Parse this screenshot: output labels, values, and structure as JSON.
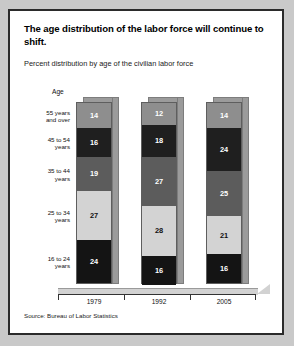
{
  "figure": {
    "title": "The age distribution of the labor force will continue to shift.",
    "subtitle": "Percent distribution by age of the civilian labor force",
    "age_header": "Age",
    "source": "Source: Bureau of Labor Statistics"
  },
  "chart_data": {
    "type": "bar",
    "subtype": "stacked-column-100-percent",
    "title": "The age distribution of the labor force will continue to shift.",
    "subtitle": "Percent distribution by age of the civilian labor force",
    "xlabel": "",
    "ylabel": "Percent distribution by age of the civilian labor force",
    "ylim": [
      0,
      100
    ],
    "grid": false,
    "legend": "left-axis-labels",
    "categories": [
      "1979",
      "1992",
      "2005"
    ],
    "series": [
      {
        "name": "16 to 24 years",
        "values": [
          24,
          16,
          16
        ],
        "color": "#141414"
      },
      {
        "name": "25 to 34 years",
        "values": [
          27,
          28,
          21
        ],
        "color": "#d3d3d3"
      },
      {
        "name": "35 to 44 years",
        "values": [
          19,
          27,
          25
        ],
        "color": "#5c5c5c"
      },
      {
        "name": "45 to 54 years",
        "values": [
          16,
          18,
          24
        ],
        "color": "#1f1f1f"
      },
      {
        "name": "55 years and over",
        "values": [
          14,
          12,
          14
        ],
        "color": "#8e8e8e"
      }
    ],
    "source": "Source: Bureau of Labor Statistics"
  },
  "age_groups": [
    {
      "label_line1": "55 years",
      "label_line2": "and over"
    },
    {
      "label_line1": "45 to 54",
      "label_line2": "years"
    },
    {
      "label_line1": "35 to 44",
      "label_line2": "years"
    },
    {
      "label_line1": "25 to 34",
      "label_line2": "years"
    },
    {
      "label_line1": "16 to 24",
      "label_line2": "years"
    }
  ],
  "years": [
    "1979",
    "1992",
    "2005"
  ],
  "bars": [
    {
      "year": "1979",
      "segments": [
        {
          "group": "55 years and over",
          "value": "14"
        },
        {
          "group": "45 to 54 years",
          "value": "16"
        },
        {
          "group": "35 to 44 years",
          "value": "19"
        },
        {
          "group": "25 to 34 years",
          "value": "27"
        },
        {
          "group": "16 to 24 years",
          "value": "24"
        }
      ]
    },
    {
      "year": "1992",
      "segments": [
        {
          "group": "55 years and over",
          "value": "12"
        },
        {
          "group": "45 to 54 years",
          "value": "18"
        },
        {
          "group": "35 to 44 years",
          "value": "27"
        },
        {
          "group": "25 to 34 years",
          "value": "28"
        },
        {
          "group": "16 to 24 years",
          "value": "16"
        }
      ]
    },
    {
      "year": "2005",
      "segments": [
        {
          "group": "55 years and over",
          "value": "14"
        },
        {
          "group": "45 to 54 years",
          "value": "24"
        },
        {
          "group": "35 to 44 years",
          "value": "25"
        },
        {
          "group": "25 to 34 years",
          "value": "21"
        },
        {
          "group": "16 to 24 years",
          "value": "16"
        }
      ]
    }
  ],
  "colors": {
    "segment_55_plus": "#8e8e8e",
    "segment_45_54": "#1f1f1f",
    "segment_35_44": "#5c5c5c",
    "segment_25_34": "#d3d3d3",
    "segment_16_24": "#141414",
    "bar_3d_face": "#9b9b9b",
    "frame_border": "#2b2b2b",
    "page_background": "#c9c9c9",
    "figure_background": "#ffffff"
  }
}
